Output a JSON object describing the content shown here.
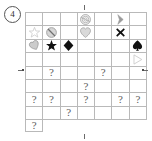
{
  "panel": {
    "label": "4",
    "label_icon": "circled-number-icon"
  },
  "grid": {
    "columns": 7,
    "rows": 8,
    "question_mark": "?",
    "colors": {
      "line": "#b9b9b9",
      "ink_black": "#111111",
      "ink_gray": "#9a9a9a",
      "ink_light": "#c8c8c8",
      "question": "#5b5b5b"
    },
    "cells": [
      [
        {
          "symbol": "empty"
        },
        {
          "symbol": "empty"
        },
        {
          "symbol": "empty"
        },
        {
          "symbol": "spiral-gray-icon"
        },
        {
          "symbol": "empty"
        },
        {
          "symbol": "arrow-gray-icon"
        },
        {
          "symbol": "empty"
        },
        {
          "symbol": "star-outline-icon"
        }
      ],
      [
        {
          "symbol": "no-entry-gray-icon"
        },
        {
          "symbol": "empty"
        },
        {
          "symbol": "heart-gray-icon"
        },
        {
          "symbol": "empty"
        },
        {
          "symbol": "cross-black-icon"
        },
        {
          "symbol": "empty"
        },
        {
          "symbol": "heart-gray-small-icon"
        }
      ],
      [
        {
          "symbol": "star-black-icon"
        },
        {
          "symbol": "diamond-black-icon"
        },
        {
          "symbol": "empty"
        },
        {
          "symbol": "empty"
        },
        {
          "symbol": "empty"
        },
        {
          "symbol": "spade-black-icon"
        },
        {
          "symbol": "empty"
        }
      ],
      [
        {
          "symbol": "empty"
        },
        {
          "symbol": "empty"
        },
        {
          "symbol": "empty"
        },
        {
          "symbol": "empty"
        },
        {
          "symbol": "empty"
        },
        {
          "symbol": "triangle-outline-icon"
        },
        {
          "symbol": "empty"
        }
      ],
      [
        {
          "symbol": "question"
        },
        {
          "symbol": "empty"
        },
        {
          "symbol": "empty"
        },
        {
          "symbol": "question"
        },
        {
          "symbol": "empty"
        },
        {
          "symbol": "empty"
        },
        {
          "symbol": "empty"
        }
      ],
      [
        {
          "symbol": "empty"
        },
        {
          "symbol": "empty"
        },
        {
          "symbol": "question"
        },
        {
          "symbol": "empty"
        },
        {
          "symbol": "empty"
        },
        {
          "symbol": "empty"
        },
        {
          "symbol": "question"
        }
      ],
      [
        {
          "symbol": "question"
        },
        {
          "symbol": "empty"
        },
        {
          "symbol": "question"
        },
        {
          "symbol": "empty"
        },
        {
          "symbol": "question"
        },
        {
          "symbol": "question"
        },
        {
          "symbol": "empty"
        }
      ],
      [
        {
          "symbol": "empty"
        },
        {
          "symbol": "question"
        },
        {
          "symbol": "empty"
        },
        {
          "symbol": "empty"
        },
        {
          "symbol": "empty"
        },
        {
          "symbol": "empty"
        },
        {
          "symbol": "question"
        }
      ]
    ]
  },
  "ticks": [
    {
      "name": "tick-top-center",
      "orient": "v",
      "x": 84,
      "y": 5
    },
    {
      "name": "tick-bottom-center",
      "orient": "v",
      "x": 84,
      "y": 134
    },
    {
      "name": "tick-left-middle",
      "orient": "h",
      "x": 18,
      "y": 70
    },
    {
      "name": "tick-right-middle",
      "orient": "h",
      "x": 143,
      "y": 70
    },
    {
      "name": "tick-dot-left",
      "orient": "dot",
      "x": 22,
      "y": 69
    },
    {
      "name": "tick-dot-right",
      "orient": "dot",
      "x": 142,
      "y": 69
    }
  ]
}
